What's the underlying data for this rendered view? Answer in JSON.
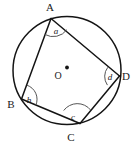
{
  "figure": {
    "kind": "cyclic-quadrilateral-in-circle",
    "canvas": {
      "width": 140,
      "height": 144,
      "background": "#ffffff"
    },
    "colors": {
      "stroke": "#141414",
      "arc_stroke": "#555555",
      "text": "#1a1a1a",
      "background": "#ffffff"
    },
    "circle": {
      "cx": 67,
      "cy": 70.5,
      "r": 54
    },
    "center": {
      "label": "O",
      "label_x": 58,
      "label_y": 79,
      "dot_x": 67,
      "dot_y": 67.5,
      "dot_r": 1.9
    },
    "vertices": [
      {
        "id": "A",
        "label": "A",
        "x": 51,
        "y": 18.5,
        "label_x": 50,
        "label_y": 11
      },
      {
        "id": "B",
        "label": "B",
        "x": 21.5,
        "y": 99,
        "label_x": 11,
        "label_y": 108
      },
      {
        "id": "C",
        "label": "C",
        "x": 80,
        "y": 123.5,
        "label_x": 71,
        "label_y": 141
      },
      {
        "id": "D",
        "label": "D",
        "x": 119.5,
        "y": 76,
        "label_x": 126,
        "label_y": 80
      }
    ],
    "edges": [
      {
        "id": "AB",
        "from": "A",
        "to": "B"
      },
      {
        "id": "BC",
        "from": "B",
        "to": "C"
      },
      {
        "id": "CD",
        "from": "C",
        "to": "D"
      },
      {
        "id": "DA",
        "from": "D",
        "to": "A"
      }
    ],
    "angles": [
      {
        "id": "a",
        "label": "a",
        "at": "A",
        "label_x": 56,
        "label_y": 34,
        "arc_r": 17
      },
      {
        "id": "b",
        "label": "b",
        "at": "B",
        "label_x": 29,
        "label_y": 103,
        "arc_r": 15
      },
      {
        "id": "c",
        "label": "c",
        "at": "C",
        "label_x": 73,
        "label_y": 120,
        "arc_r": 17
      },
      {
        "id": "d",
        "label": "d",
        "at": "D",
        "label_x": 110,
        "label_y": 80,
        "arc_r": 15
      }
    ]
  }
}
